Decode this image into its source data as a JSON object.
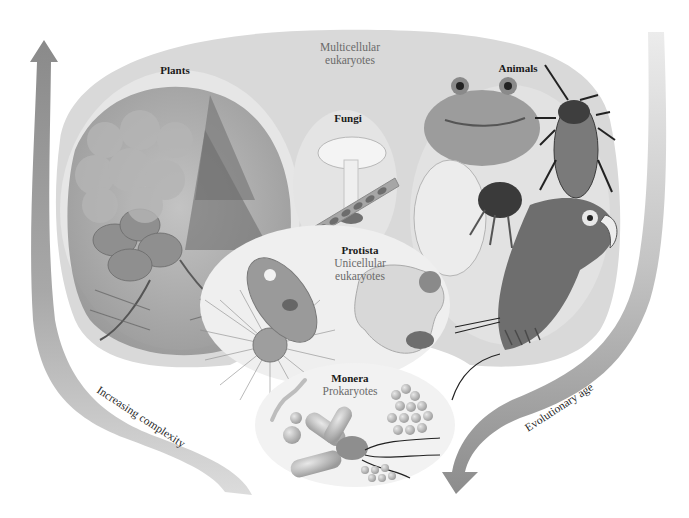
{
  "colors": {
    "background": "#ffffff",
    "outer_region": "#d9d9d9",
    "plants_oval": "#e6e6e6",
    "fungi_oval": "#e4e4e4",
    "animals_oval": "#e2e2e2",
    "protista_oval": "#efefef",
    "monera_oval": "#f2f2f2",
    "arrow_fill": "#9a9a9a",
    "band_fill": "#d4d4d4",
    "heading_text": "#1a1a1a",
    "subtitle_text": "#6a6a6a"
  },
  "group_label": {
    "line1": "Multicellular",
    "line2": "eukaryotes"
  },
  "kingdoms": [
    {
      "id": "plants",
      "name": "Plants",
      "subtitle": [],
      "illustrations": [
        "tree",
        "fern",
        "flowering-plant"
      ]
    },
    {
      "id": "fungi",
      "name": "Fungi",
      "subtitle": [],
      "illustrations": [
        "mushroom",
        "mold-hypha"
      ]
    },
    {
      "id": "animals",
      "name": "Animals",
      "subtitle": [],
      "illustrations": [
        "frog",
        "cockroach",
        "nautilus",
        "parrot"
      ]
    },
    {
      "id": "protista",
      "name": "Protista",
      "subtitle": [
        "Unicellular",
        "eukaryotes"
      ],
      "illustrations": [
        "paramecium",
        "radiolarian",
        "amoeba"
      ]
    },
    {
      "id": "monera",
      "name": "Monera",
      "subtitle": [
        "Prokaryotes"
      ],
      "illustrations": [
        "spirillum",
        "cocci",
        "bacilli",
        "flagellated-bacterium"
      ]
    }
  ],
  "arrows": {
    "left": {
      "label": "Increasing complexity",
      "direction": "up"
    },
    "right": {
      "label": "Evolutionary age",
      "direction": "down"
    }
  }
}
